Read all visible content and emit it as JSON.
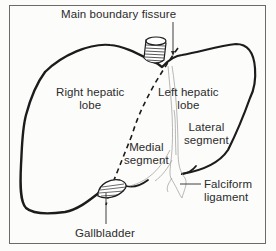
{
  "figure": {
    "colors": {
      "outline": "#1c1c1c",
      "frame": "#6b6b6b",
      "label_text": "#2b2b2b",
      "ligament": "#9a9a9a",
      "background": "#fcfcfb"
    }
  },
  "labels": {
    "main_boundary_fissure": "Main boundary fissure",
    "right_hepatic_lobe": {
      "line1": "Right hepatic",
      "line2": "lobe"
    },
    "left_hepatic_lobe": {
      "line1": "Left hepatic",
      "line2": "lobe"
    },
    "lateral_segment": {
      "line1": "Lateral",
      "line2": "segment"
    },
    "medial_segment": {
      "line1": "Medial",
      "line2": "segment"
    },
    "falciform_ligament": {
      "line1": "Falciform",
      "line2": "ligament"
    },
    "gallbladder": "Gallbladder"
  }
}
